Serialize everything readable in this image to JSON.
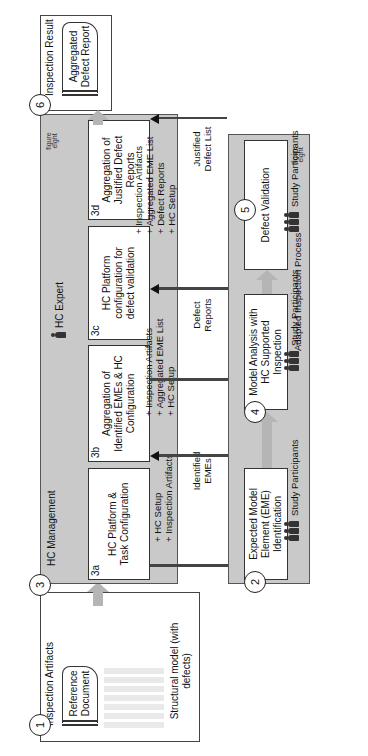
{
  "diagram": {
    "inputs": {
      "number": "1",
      "title": "Inspection Artifacts",
      "document_label": "Reference Document",
      "model_caption": "Structural model (with defects)"
    },
    "hc_management": {
      "number": "3",
      "title": "HC Management",
      "role": "HC Expert",
      "logo": "figure eight",
      "steps": [
        {
          "id": "3a",
          "label": "HC Platform & Task Configuration"
        },
        {
          "id": "3b",
          "label": "Aggregation of Identified EMEs & HC Configuration"
        },
        {
          "id": "3c",
          "label": "HC Platform configuration for defect validation"
        },
        {
          "id": "3d",
          "label": "Aggregation of Justified Defect Reports"
        }
      ]
    },
    "result": {
      "number": "6",
      "title": "Inspection Result",
      "document_label": "Aggregated Defect Report"
    },
    "flows": {
      "to_2": [
        "+ HC Setup",
        "+ Inspection Artifacts"
      ],
      "to_4": [
        "+ Inspection Artifacts",
        "+ Aggregated EME List",
        "+ HC Setup"
      ],
      "to_5": [
        "+ Inspection Artifacts",
        "+ Aggregated EME List",
        "+ Defect Reports",
        "+ HC Setup"
      ],
      "from_2": "Identified EMEs",
      "from_4": "Defect Reports",
      "from_5": "Justified Defect List"
    },
    "adapted_process": {
      "title": "Adapted Inspection Process",
      "logo": "figure eight",
      "steps": [
        {
          "number": "2",
          "label": "Expected Model Element (EME) Identification",
          "actor": "Study Participants"
        },
        {
          "number": "4",
          "label": "Model Analysis with HC Supported Inspection",
          "actor": "Study Participants"
        },
        {
          "number": "5",
          "label": "Defect Validation",
          "actor": "Study Participants"
        }
      ]
    }
  }
}
